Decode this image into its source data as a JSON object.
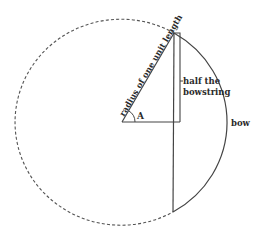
{
  "diagram": {
    "labels": {
      "radius": "radius of one unit length",
      "angle": "A",
      "half_line1": "half the",
      "half_line2": "bowstring",
      "bow": "bow"
    },
    "colors": {
      "stroke": "#444444",
      "dashed": "#555555",
      "background": "#ffffff"
    }
  }
}
